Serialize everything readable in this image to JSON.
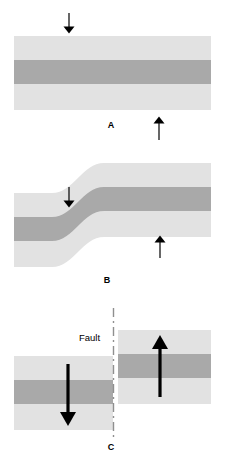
{
  "figure": {
    "type": "geological-diagram",
    "background_color": "#ffffff"
  },
  "colors": {
    "light_rock": "#e2e2e2",
    "dark_rock": "#a9a9a9",
    "stroke": "#000000",
    "fault_line": "#9a9a9a"
  },
  "panels": [
    {
      "id": "A",
      "label": "A",
      "caption": "Undeformed horizontal strata with opposing stress",
      "label_x": 111,
      "label_y": 126,
      "arrows": [
        {
          "name": "stress-arrow-down",
          "direction": "down",
          "weight": "thin",
          "x": 69,
          "y_start": 13,
          "y_end": 33
        },
        {
          "name": "stress-arrow-up",
          "direction": "up",
          "weight": "thin",
          "x": 159,
          "y_start": 140,
          "y_end": 117
        }
      ]
    },
    {
      "id": "B",
      "label": "B",
      "caption": "Strata bend into an S-shaped flexure under stress",
      "label_x": 107,
      "label_y": 281,
      "arrows": [
        {
          "name": "stress-arrow-down",
          "direction": "down",
          "weight": "thin",
          "x": 69,
          "y_start": 187,
          "y_end": 207
        },
        {
          "name": "stress-arrow-up",
          "direction": "up",
          "weight": "thin",
          "x": 160,
          "y_start": 258,
          "y_end": 236
        }
      ]
    },
    {
      "id": "C",
      "label": "C",
      "caption": "Rock ruptures along a fault; blocks slip in opposite directions",
      "label_x": 111,
      "label_y": 448,
      "fault_label": "Fault",
      "fault_label_x": 79,
      "fault_label_y": 338,
      "fault_line_x": 113,
      "fault_line_y_start": 308,
      "fault_line_y_end": 440,
      "arrows": [
        {
          "name": "displacement-arrow-down",
          "direction": "down",
          "weight": "thick",
          "x": 68,
          "y_start": 364,
          "y_end": 425
        },
        {
          "name": "displacement-arrow-up",
          "direction": "up",
          "weight": "thick",
          "x": 160,
          "y_start": 397,
          "y_end": 337
        }
      ]
    }
  ],
  "strata": {
    "panel_a": {
      "block_left": 14,
      "block_right": 211,
      "top": 36,
      "bottom": 110,
      "dark_band_top": 60,
      "dark_band_bottom": 84
    },
    "panel_b": {
      "left": 14,
      "right": 211,
      "left_top": 193,
      "right_top": 163,
      "thickness": 74,
      "dark_band_offset": 24,
      "dark_band_thickness": 24
    },
    "panel_c": {
      "left_block": {
        "x": 14,
        "width": 99,
        "top": 356,
        "bottom": 430,
        "dark_top": 380,
        "dark_bottom": 404
      },
      "right_block": {
        "x": 118,
        "width": 93,
        "top": 330,
        "bottom": 404,
        "dark_top": 354,
        "dark_bottom": 378
      }
    }
  }
}
